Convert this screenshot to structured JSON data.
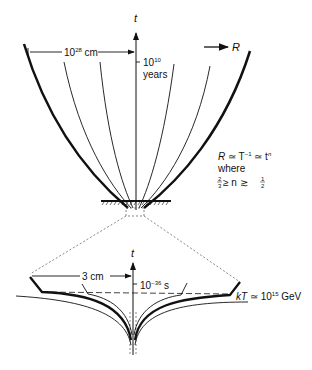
{
  "upper": {
    "axis_label": "t",
    "r_label": "R",
    "width_label": "10",
    "width_exp": "28",
    "width_unit": " cm",
    "time_label": "10",
    "time_exp": "10",
    "time_unit": "years"
  },
  "formula": {
    "line1_R": "R",
    "line1_rest": " ≃ T",
    "line1_exp": "−1",
    "line1_tail": " ≃ t",
    "line1_n": "n",
    "line2": "where",
    "line3_left_num": "2",
    "line3_left_den": "3",
    "line3_mid": " ≥ n ≳ ",
    "line3_right_num": "1",
    "line3_right_den": "2"
  },
  "lower": {
    "axis_label": "t",
    "width_label": "3 cm",
    "time_label": "10",
    "time_exp": "−36",
    "time_unit": " s",
    "temp_label_k": "kT",
    "temp_label_rest": " ≃ 10",
    "temp_exp": "15",
    "temp_unit": " GeV"
  },
  "colors": {
    "ink": "#111111",
    "dashed": "#555555"
  }
}
